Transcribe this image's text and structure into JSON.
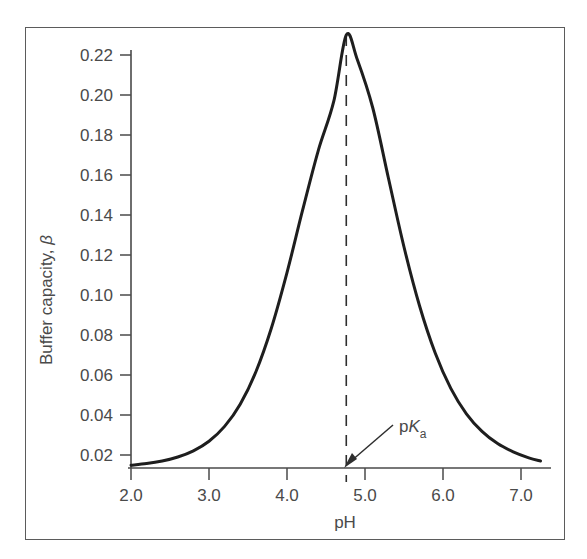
{
  "figure": {
    "background_color": "#ffffff",
    "frame_color": "#5b5b5b",
    "curve_color": "#1e1e1e",
    "axis_color": "#4a4a4a"
  },
  "axes": {
    "x_title": "pH",
    "y_title_prefix": "Buffer capacity, ",
    "y_title_symbol": "β",
    "x_ticks": [
      "2.0",
      "3.0",
      "4.0",
      "5.0",
      "6.0",
      "7.0"
    ],
    "y_ticks": [
      "0.02",
      "0.04",
      "0.06",
      "0.08",
      "0.10",
      "0.12",
      "0.14",
      "0.16",
      "0.18",
      "0.20",
      "0.22"
    ]
  },
  "annotation": {
    "label_p": "p",
    "label_k": "K",
    "label_sub": "a",
    "label_full": "pKa",
    "points_to_x": 4.76,
    "points_to_y": 0.0
  },
  "chart_data": {
    "type": "line",
    "title": "",
    "subtitle": "",
    "xlabel": "pH",
    "ylabel": "Buffer capacity, β",
    "xlim": [
      1.85,
      7.45
    ],
    "ylim": [
      0.0,
      0.2275
    ],
    "grid": false,
    "legend": null,
    "xticks": [
      2.0,
      3.0,
      4.0,
      5.0,
      6.0,
      7.0
    ],
    "yticks": [
      0.02,
      0.04,
      0.06,
      0.08,
      0.1,
      0.12,
      0.14,
      0.16,
      0.18,
      0.2,
      0.22
    ],
    "annotations": [
      {
        "text": "pKa",
        "x": 4.76,
        "y": 0.0,
        "kind": "arrow-label"
      },
      {
        "text": "",
        "x": 4.76,
        "kind": "vertical-dashed-line",
        "from_y": 0.0,
        "to_y": 0.2165
      }
    ],
    "series": [
      {
        "name": "Buffer capacity",
        "peak_x": 4.76,
        "peak_y": 0.2165,
        "x": [
          2.0,
          2.2,
          2.4,
          2.6,
          2.8,
          3.0,
          3.2,
          3.4,
          3.6,
          3.8,
          4.0,
          4.2,
          4.4,
          4.6,
          4.76,
          4.9,
          5.1,
          5.3,
          5.5,
          5.7,
          5.9,
          6.1,
          6.3,
          6.5,
          6.7,
          6.9,
          7.1,
          7.25
        ],
        "y": [
          0.0014,
          0.0022,
          0.0035,
          0.0055,
          0.0086,
          0.0134,
          0.0208,
          0.0319,
          0.048,
          0.07,
          0.0977,
          0.1289,
          0.1586,
          0.1834,
          0.2165,
          0.2044,
          0.18,
          0.145,
          0.1105,
          0.081,
          0.0575,
          0.0398,
          0.0271,
          0.0183,
          0.0122,
          0.0081,
          0.0051,
          0.0035
        ]
      }
    ]
  }
}
